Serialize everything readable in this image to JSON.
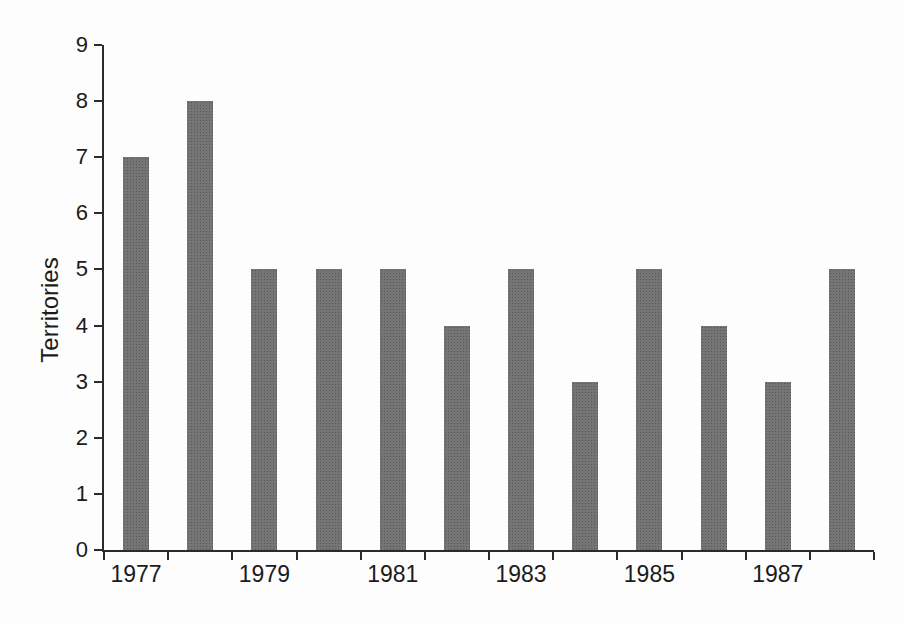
{
  "figure": {
    "background": "#fdfdfd",
    "bar_base_color": "#757575",
    "bar_dot_color": "#555555",
    "axis_color": "#2b2b2b",
    "text_color": "#1b1b1b"
  },
  "chart_data": {
    "type": "bar",
    "title": "",
    "xlabel": "",
    "ylabel": "Territories",
    "categories": [
      "1977",
      "1978",
      "1979",
      "1980",
      "1981",
      "1982",
      "1983",
      "1984",
      "1985",
      "1986",
      "1987",
      "1988"
    ],
    "values": [
      7,
      8,
      5,
      5,
      5,
      4,
      5,
      3,
      5,
      4,
      3,
      5
    ],
    "ylim": [
      0,
      9
    ],
    "y_tick_step": 1,
    "y_tick_labels": [
      "0",
      "1",
      "2",
      "3",
      "4",
      "5",
      "6",
      "7",
      "8",
      "9"
    ],
    "x_tick_labels_shown": [
      "1977",
      "1979",
      "1981",
      "1983",
      "1985",
      "1987"
    ],
    "x_label_every": 2,
    "grid": false,
    "legend": null
  }
}
